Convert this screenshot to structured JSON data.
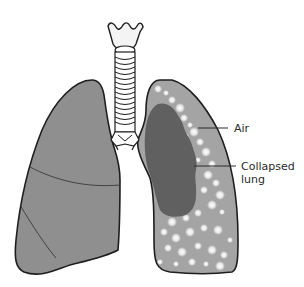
{
  "diagram": {
    "labels": {
      "air": "Air",
      "collapsed_line1": "Collapsed",
      "collapsed_line2": "lung"
    },
    "parts": [
      "trachea",
      "larynx",
      "right-lung",
      "left-lung-pleural-space",
      "collapsed-lung"
    ],
    "colors": {
      "background": "#ffffff",
      "lung_fill": "#8f8f8f",
      "pleural_air_fill": "#a4a4a4",
      "collapsed_lung_fill": "#606060",
      "outline": "#1e1e1e",
      "trachea_fill": "#f4f4f4",
      "air_bubble": "#ffffff"
    }
  }
}
